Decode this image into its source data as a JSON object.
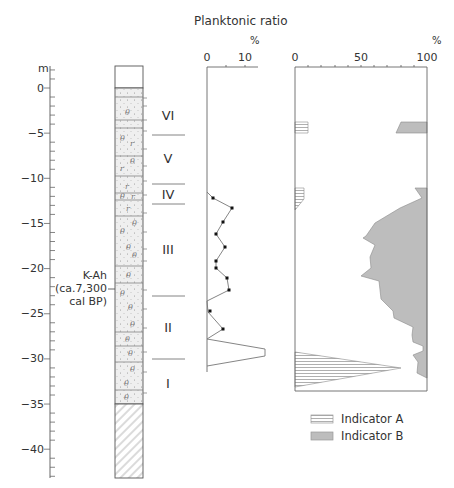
{
  "chart_data": [
    {
      "type": "stratigraphic_column",
      "title": "",
      "ylabel": "m",
      "yticks": [
        0,
        -5,
        -10,
        -15,
        -20,
        -25,
        -30,
        -35,
        -40
      ],
      "ylim": [
        2.5,
        -43.2
      ],
      "column_top": 2.5,
      "column_bottom": -43.2,
      "sediment_base": -35.0,
      "units": [
        {
          "label": "VI",
          "top": 2.5,
          "bottom": -5.2
        },
        {
          "label": "V",
          "top": -5.2,
          "bottom": -10.6
        },
        {
          "label": "IV",
          "top": -10.6,
          "bottom": -12.9
        },
        {
          "label": "III",
          "top": -12.9,
          "bottom": -23.3
        },
        {
          "label": "II",
          "top": -23.3,
          "bottom": -30.0
        },
        {
          "label": "I",
          "top": -30.0,
          "bottom": -35.0
        }
      ],
      "annotation": {
        "text": [
          "K-Ah",
          "(ca.7,300",
          "cal BP)"
        ],
        "depth": -22.6
      }
    },
    {
      "type": "line",
      "title": "Planktonic ratio",
      "xlabel": "%",
      "xticks": [
        0,
        10
      ],
      "xlim": [
        0,
        12.5
      ],
      "series": [
        {
          "name": "Planktonic ratio",
          "points": [
            {
              "depth": -11.5,
              "value": 0
            },
            {
              "depth": -13.5,
              "value": 1.5
            },
            {
              "depth": -14.5,
              "value": 5.8
            },
            {
              "depth": -16.5,
              "value": 3.5
            },
            {
              "depth": -18.5,
              "value": 2.2
            },
            {
              "depth": -19.8,
              "value": 3.8
            },
            {
              "depth": -21.5,
              "value": 2.5
            },
            {
              "depth": -22.0,
              "value": 2.5
            },
            {
              "depth": -23.5,
              "value": 4.6
            },
            {
              "depth": -24.5,
              "value": 5.0
            },
            {
              "depth": -26.3,
              "value": 0
            },
            {
              "depth": -26.8,
              "value": 0.6
            },
            {
              "depth": -28.4,
              "value": 4.3
            },
            {
              "depth": -29.5,
              "value": 0
            },
            {
              "depth": -30.5,
              "value": 15
            },
            {
              "depth": -31.0,
              "value": 15
            },
            {
              "depth": -33.8,
              "value": 0
            }
          ],
          "markers_at_depths": [
            -13.5,
            -14.5,
            -16.5,
            -18.5,
            -19.8,
            -21.5,
            -22.0,
            -23.5,
            -24.5,
            -26.8,
            -28.4
          ]
        }
      ]
    },
    {
      "type": "area",
      "title": "",
      "xlabel": "%",
      "xticks": [
        0,
        50,
        100
      ],
      "xlim": [
        0,
        100
      ],
      "legend": [
        "Indicator A",
        "Indicator B"
      ],
      "legend_position": "bottom",
      "series": [
        {
          "name": "Indicator A",
          "from": "left",
          "segments": [
            [
              {
                "depth": -3.7,
                "value": 10
              },
              {
                "depth": -5.0,
                "value": 10
              }
            ],
            [
              {
                "depth": -10.9,
                "value": 7
              },
              {
                "depth": -12.3,
                "value": 7
              },
              {
                "depth": -13.5,
                "value": 0
              }
            ],
            [
              {
                "depth": -30.1,
                "value": 0
              },
              {
                "depth": -32.6,
                "value": 80
              },
              {
                "depth": -34.8,
                "value": 0
              }
            ]
          ]
        },
        {
          "name": "Indicator B",
          "from": "right",
          "segments": [
            [
              {
                "depth": -3.7,
                "value": 79
              },
              {
                "depth": -5.0,
                "value": 75
              }
            ],
            [
              {
                "depth": -10.9,
                "value": 90
              },
              {
                "depth": -12.0,
                "value": 97
              },
              {
                "depth": -13.5,
                "value": 88
              },
              {
                "depth": -16.0,
                "value": 60
              },
              {
                "depth": -17.0,
                "value": 55
              },
              {
                "depth": -18.8,
                "value": 52
              },
              {
                "depth": -20.8,
                "value": 60
              },
              {
                "depth": -22.6,
                "value": 50
              },
              {
                "depth": -24.6,
                "value": 65
              },
              {
                "depth": -26.0,
                "value": 67
              },
              {
                "depth": -26.4,
                "value": 78
              },
              {
                "depth": -27.2,
                "value": 95
              },
              {
                "depth": -28.8,
                "value": 97
              },
              {
                "depth": -29.8,
                "value": 95
              },
              {
                "depth": -31.0,
                "value": 96
              },
              {
                "depth": -32.3,
                "value": 93
              },
              {
                "depth": -34.0,
                "value": 98
              }
            ]
          ]
        }
      ]
    }
  ],
  "labels": {
    "depth_unit": "m",
    "planktonic_title": "Planktonic ratio",
    "pct_left": "%",
    "pct_right": "%",
    "k_ah_1": "K-Ah",
    "k_ah_2": "(ca.7,300",
    "k_ah_3": "cal BP)",
    "legend_a": "Indicator A",
    "legend_b": "Indicator B",
    "tick_0": "0",
    "tick_m5": "−5",
    "tick_m10": "−10",
    "tick_m15": "−15",
    "tick_m20": "−20",
    "tick_m25": "−25",
    "tick_m30": "−30",
    "tick_m35": "−35",
    "tick_m40": "−40",
    "pl_0": "0",
    "pl_10": "10",
    "ind_0": "0",
    "ind_50": "50",
    "ind_100": "100",
    "unit_VI": "VI",
    "unit_V": "V",
    "unit_IV": "IV",
    "unit_III": "III",
    "unit_II": "II",
    "unit_I": "I"
  },
  "colors": {
    "line": "#666666",
    "fill_b": "#bdbdbd",
    "hatch": "#9a9a9a",
    "column_fill": "#ececec"
  }
}
